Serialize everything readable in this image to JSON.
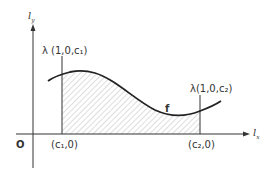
{
  "diagram": {
    "y_axis_label": "l",
    "y_axis_subscript": "y",
    "x_axis_label": "l",
    "x_axis_subscript": "x",
    "origin_label": "O",
    "curve_label": "f",
    "c1_top_label": "λ (1,0,c₁)",
    "c2_top_label": "λ(1,0,c₂)",
    "c1_bottom_label": "(c₁,0)",
    "c2_bottom_label": "(c₂,0)",
    "colors": {
      "ink": "#333333",
      "hatch": "#999999",
      "background": "#ffffff"
    }
  }
}
